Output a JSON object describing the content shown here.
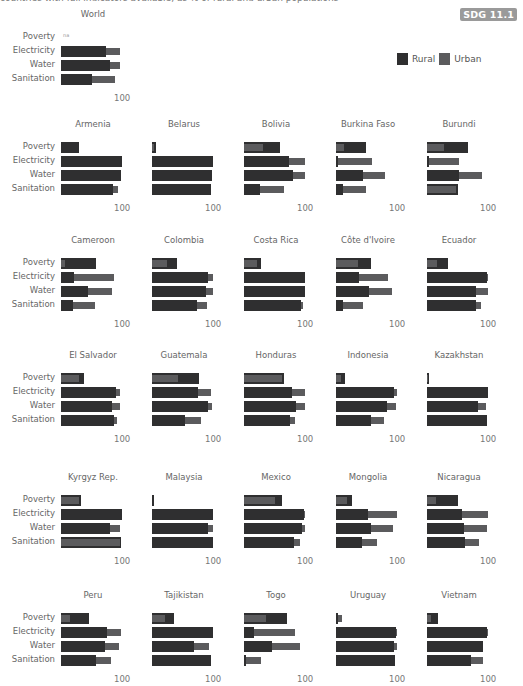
{
  "header": {
    "cut_text": "countries with full indicators available, as % of rural and urban populations",
    "badge": "SDG 11.1"
  },
  "legend": {
    "items": [
      {
        "label": "Rural",
        "color": "#2f2f30"
      },
      {
        "label": "Urban",
        "color": "#5b5b5d"
      }
    ]
  },
  "chart_data": {
    "type": "bar",
    "orientation": "horizontal",
    "layout": "small-multiples",
    "categories": [
      "Poverty",
      "Electricity",
      "Water",
      "Sanitation"
    ],
    "series_names": [
      "Rural",
      "Urban"
    ],
    "axis_tick": "100",
    "xlim": [
      0,
      100
    ],
    "panels": [
      {
        "name": "World",
        "rural": [
          null,
          74,
          81,
          50
        ],
        "urban": [
          null,
          97,
          96,
          88
        ],
        "note": "na"
      },
      {
        "name": "Armenia",
        "rural": [
          30,
          100,
          99,
          85
        ],
        "urban": [
          30,
          100,
          99,
          93
        ]
      },
      {
        "name": "Belarus",
        "rural": [
          6,
          100,
          99,
          97
        ],
        "urban": [
          4,
          100,
          99,
          97
        ]
      },
      {
        "name": "Bolivia",
        "rural": [
          59,
          73,
          80,
          27
        ],
        "urban": [
          31,
          100,
          100,
          66
        ]
      },
      {
        "name": "Burkina Faso",
        "rural": [
          49,
          1,
          44,
          12
        ],
        "urban": [
          13,
          59,
          80,
          49
        ]
      },
      {
        "name": "Burundi",
        "rural": [
          68,
          2,
          52,
          51
        ],
        "urban": [
          28,
          52,
          90,
          47
        ]
      },
      {
        "name": "Cameroon",
        "rural": [
          57,
          22,
          44,
          19
        ],
        "urban": [
          6,
          87,
          84,
          56
        ]
      },
      {
        "name": "Colombia",
        "rural": [
          41,
          92,
          88,
          73
        ],
        "urban": [
          24,
          100,
          100,
          90
        ]
      },
      {
        "name": "Costa Rica",
        "rural": [
          28,
          100,
          100,
          94
        ],
        "urban": [
          21,
          100,
          100,
          97
        ]
      },
      {
        "name": "Côte d'Ivoire",
        "rural": [
          57,
          37,
          54,
          12
        ],
        "urban": [
          36,
          85,
          91,
          45
        ]
      },
      {
        "name": "Ecuador",
        "rural": [
          35,
          98,
          80,
          80
        ],
        "urban": [
          17,
          100,
          100,
          89
        ]
      },
      {
        "name": "El Salvador",
        "rural": [
          38,
          90,
          83,
          87
        ],
        "urban": [
          29,
          97,
          97,
          92
        ]
      },
      {
        "name": "Guatemala",
        "rural": [
          77,
          76,
          91,
          54
        ],
        "urban": [
          43,
          96,
          99,
          81
        ]
      },
      {
        "name": "Honduras",
        "rural": [
          65,
          78,
          86,
          76
        ],
        "urban": [
          62,
          100,
          100,
          84
        ]
      },
      {
        "name": "Indonesia",
        "rural": [
          14,
          95,
          83,
          58
        ],
        "urban": [
          8,
          100,
          98,
          79
        ]
      },
      {
        "name": "Kazakhstan",
        "rural": [
          3,
          100,
          84,
          99
        ],
        "urban": [
          1,
          100,
          96,
          99
        ]
      },
      {
        "name": "Kyrgyz Rep.",
        "rural": [
          33,
          100,
          81,
          99
        ],
        "urban": [
          30,
          100,
          96,
          96
        ]
      },
      {
        "name": "Malaysia",
        "rural": [
          1,
          100,
          91,
          100
        ],
        "urban": [
          1,
          100,
          100,
          100
        ]
      },
      {
        "name": "Mexico",
        "rural": [
          63,
          99,
          95,
          82
        ],
        "urban": [
          50,
          100,
          100,
          92
        ]
      },
      {
        "name": "Mongolia",
        "rural": [
          26,
          52,
          57,
          42
        ],
        "urban": [
          18,
          100,
          94,
          67
        ]
      },
      {
        "name": "Nicaragua",
        "rural": [
          50,
          57,
          61,
          62
        ],
        "urban": [
          15,
          100,
          99,
          86
        ]
      },
      {
        "name": "Peru",
        "rural": [
          46,
          75,
          72,
          58
        ],
        "urban": [
          15,
          99,
          95,
          82
        ]
      },
      {
        "name": "Tajikistan",
        "rural": [
          36,
          100,
          69,
          97
        ],
        "urban": [
          22,
          100,
          94,
          97
        ]
      },
      {
        "name": "Togo",
        "rural": [
          70,
          16,
          46,
          2
        ],
        "urban": [
          36,
          84,
          91,
          28
        ]
      },
      {
        "name": "Uruguay",
        "rural": [
          3,
          99,
          95,
          97
        ],
        "urban": [
          10,
          100,
          100,
          97
        ]
      },
      {
        "name": "Vietnam",
        "rural": [
          18,
          99,
          92,
          72
        ],
        "urban": [
          6,
          100,
          92,
          91
        ]
      }
    ]
  }
}
